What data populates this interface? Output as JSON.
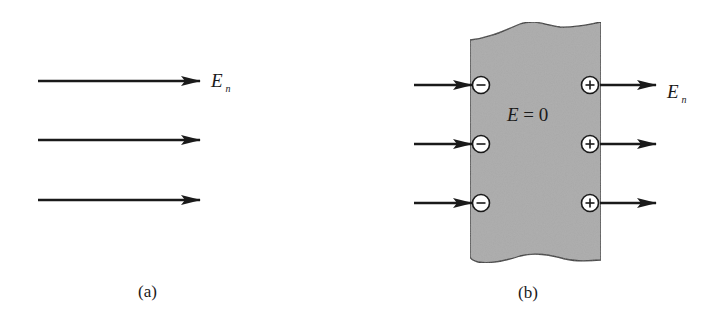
{
  "panel_a": {
    "field_label": {
      "symbol": "E",
      "subscript": "n"
    },
    "arrows": [
      {
        "x1": 38,
        "x2": 200,
        "y": 81
      },
      {
        "x1": 38,
        "x2": 200,
        "y": 140
      },
      {
        "x1": 38,
        "x2": 200,
        "y": 200
      }
    ],
    "caption": "(a)"
  },
  "panel_b": {
    "field_label": {
      "symbol": "E",
      "subscript": "n"
    },
    "interior_label": {
      "symbol": "E",
      "rest": " = 0"
    },
    "slab_color": "#a8a8a8",
    "incoming_arrows": [
      {
        "x1": 414,
        "x2": 472,
        "y": 85
      },
      {
        "x1": 414,
        "x2": 472,
        "y": 144
      },
      {
        "x1": 414,
        "x2": 472,
        "y": 203
      }
    ],
    "outgoing_arrows": [
      {
        "x1": 600,
        "x2": 656,
        "y": 85
      },
      {
        "x1": 600,
        "x2": 656,
        "y": 144
      },
      {
        "x1": 600,
        "x2": 656,
        "y": 203
      }
    ],
    "negative_charges": [
      {
        "cx": 481,
        "cy": 85,
        "sign": "−"
      },
      {
        "cx": 481,
        "cy": 144,
        "sign": "−"
      },
      {
        "cx": 481,
        "cy": 203,
        "sign": "−"
      }
    ],
    "positive_charges": [
      {
        "cx": 590,
        "cy": 85,
        "sign": "+"
      },
      {
        "cx": 590,
        "cy": 144,
        "sign": "+"
      },
      {
        "cx": 590,
        "cy": 203,
        "sign": "+"
      }
    ],
    "caption": "(b)"
  }
}
